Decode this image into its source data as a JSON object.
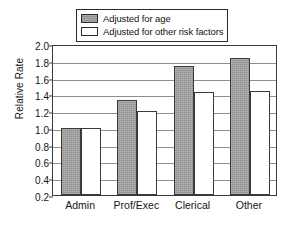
{
  "chart_data": {
    "type": "bar",
    "title": "",
    "xlabel": "",
    "ylabel": "Relative Rate",
    "categories": [
      "Admin",
      "Prof/Exec",
      "Clerical",
      "Other"
    ],
    "series": [
      {
        "name": "Adjusted for age",
        "values": [
          1.0,
          1.33,
          1.74,
          1.83
        ],
        "color": "#919191",
        "fill": "gray"
      },
      {
        "name": "Adjusted for other risk factors",
        "values": [
          1.0,
          1.2,
          1.43,
          1.44
        ],
        "color": "#ffffff",
        "fill": "open"
      }
    ],
    "ylim": [
      0.2,
      2.0
    ],
    "ytick_labels": [
      "2.0",
      "1.8",
      "1.6",
      "1.4",
      "1.2",
      "1.0",
      "0.8",
      "0.6",
      "0.4",
      "0.2"
    ],
    "ytick_values": [
      2.0,
      1.8,
      1.6,
      1.4,
      1.2,
      1.0,
      0.8,
      0.6,
      0.4,
      0.2
    ],
    "grid": true,
    "grid_axis": "y",
    "legend_position": "top-center",
    "legend_boxed": true
  },
  "legend": {
    "items": [
      {
        "label": "Adjusted for age",
        "swatch": "filled-gray-swatch"
      },
      {
        "label": "Adjusted for other risk factors",
        "swatch": "open-white-swatch"
      }
    ]
  },
  "axes": {
    "y_title": "Relative Rate"
  }
}
